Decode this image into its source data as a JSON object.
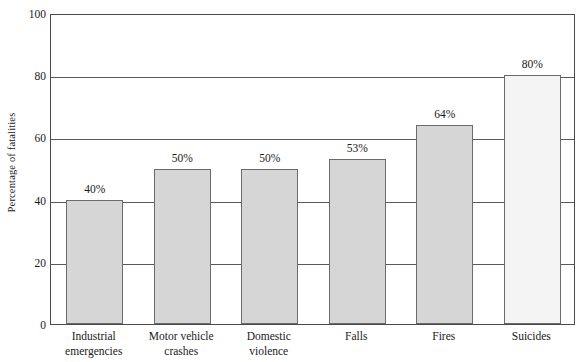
{
  "chart_data": {
    "type": "bar",
    "title": "",
    "xlabel": "",
    "ylabel": "Percentage of fatalities",
    "ylim": [
      0,
      100
    ],
    "yticks": [
      0,
      20,
      40,
      60,
      80,
      100
    ],
    "ytick_labels": [
      "0",
      "20",
      "40",
      "60",
      "80",
      "100"
    ],
    "grid": true,
    "legend": "none",
    "categories": [
      "Industrial emergencies",
      "Motor vehicle crashes",
      "Domestic violence",
      "Falls",
      "Fires",
      "Suicides"
    ],
    "category_lines": [
      [
        "Industrial",
        "emergencies"
      ],
      [
        "Motor vehicle",
        "crashes"
      ],
      [
        "Domestic",
        "violence"
      ],
      [
        "Falls"
      ],
      [
        "Fires"
      ],
      [
        "Suicides"
      ]
    ],
    "values": [
      40,
      50,
      50,
      53,
      64,
      80
    ],
    "data_labels": [
      "40%",
      "50%",
      "50%",
      "53%",
      "64%",
      "80%"
    ],
    "bar_colors": [
      "#d6d6d6",
      "#d6d6d6",
      "#d6d6d6",
      "#d6d6d6",
      "#d6d6d6",
      "#f4f4f4"
    ],
    "bar_edge_color": "#6b6b6b",
    "axis_color": "#4a4a4a",
    "grid_color": "#5a5a5a",
    "background": "#ffffff"
  }
}
